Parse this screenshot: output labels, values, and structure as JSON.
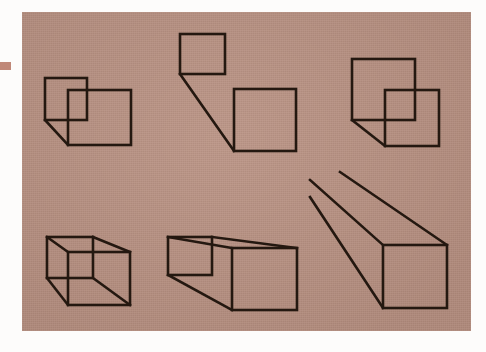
{
  "scene": {
    "title": "Line drawings of cubes and boxes in varying stages of construction",
    "background_color": "#ffffff",
    "panel_color": "#b89080",
    "line_color": "#241810",
    "edge_mark_color": "#c08878",
    "panel": {
      "x": 22,
      "y": 12,
      "width": 449,
      "height": 319
    },
    "edge_mark": {
      "x": 0,
      "y": 62,
      "width": 11,
      "height": 8
    }
  },
  "figures": [
    {
      "id": "figure-1",
      "name": "overlapping-squares-small-behind",
      "position": "top-left",
      "description": "A small square upper-left overlapping a larger square lower-right, joined by one diagonal line between their lower-left corners",
      "squares": [
        {
          "name": "back-square",
          "x": 45,
          "y": 78,
          "width": 42,
          "height": 42
        },
        {
          "name": "front-square",
          "x": 68,
          "y": 90,
          "width": 63,
          "height": 55
        }
      ],
      "connectors": [
        {
          "name": "lower-left-diagonal",
          "x1": 45,
          "y1": 120,
          "x2": 68,
          "y2": 145
        }
      ]
    },
    {
      "id": "figure-2",
      "name": "separated-squares-single-connector",
      "position": "top-center",
      "description": "Two detached squares — a small one upper-left, a larger one lower-right — joined by a single long diagonal",
      "squares": [
        {
          "name": "back-square",
          "x": 180,
          "y": 34,
          "width": 45,
          "height": 40
        },
        {
          "name": "front-square",
          "x": 234,
          "y": 89,
          "width": 62,
          "height": 62
        }
      ],
      "connectors": [
        {
          "name": "lower-left-diagonal",
          "x1": 180,
          "y1": 74,
          "x2": 234,
          "y2": 151
        }
      ]
    },
    {
      "id": "figure-3",
      "name": "overlapping-squares-large-behind",
      "position": "top-right",
      "description": "A large square upper-left overlapping a smaller square lower-right, joined by one diagonal between their lower-left corners",
      "squares": [
        {
          "name": "back-square",
          "x": 352,
          "y": 59,
          "width": 63,
          "height": 61
        },
        {
          "name": "front-square",
          "x": 385,
          "y": 90,
          "width": 54,
          "height": 56
        }
      ],
      "connectors": [
        {
          "name": "lower-left-diagonal",
          "x1": 352,
          "y1": 120,
          "x2": 385,
          "y2": 146
        }
      ]
    },
    {
      "id": "figure-4",
      "name": "wireframe-cube",
      "position": "bottom-left",
      "description": "A complete transparent wireframe cube: two overlapping squares joined at all four corners",
      "squares": [
        {
          "name": "back-square",
          "x": 47,
          "y": 237,
          "width": 46,
          "height": 41
        },
        {
          "name": "front-square",
          "x": 68,
          "y": 252,
          "width": 62,
          "height": 53
        }
      ],
      "connectors": [
        {
          "name": "top-left-edge",
          "x1": 47,
          "y1": 237,
          "x2": 68,
          "y2": 252
        },
        {
          "name": "top-right-edge",
          "x1": 93,
          "y1": 237,
          "x2": 130,
          "y2": 252
        },
        {
          "name": "bottom-left-edge",
          "x1": 47,
          "y1": 278,
          "x2": 68,
          "y2": 305
        },
        {
          "name": "bottom-right-edge",
          "x1": 93,
          "y1": 278,
          "x2": 130,
          "y2": 305
        }
      ]
    },
    {
      "id": "figure-5",
      "name": "elongated-box",
      "position": "bottom-center",
      "description": "An elongated open box: a small far square at the left joined by long edges to a larger near square at the right",
      "squares": [
        {
          "name": "back-square",
          "x": 168,
          "y": 237,
          "width": 44,
          "height": 38
        },
        {
          "name": "front-square",
          "x": 232,
          "y": 248,
          "width": 65,
          "height": 62
        }
      ],
      "connectors": [
        {
          "name": "top-left-edge",
          "x1": 168,
          "y1": 237,
          "x2": 232,
          "y2": 248
        },
        {
          "name": "top-right-edge",
          "x1": 212,
          "y1": 237,
          "x2": 297,
          "y2": 248
        },
        {
          "name": "bottom-left-edge",
          "x1": 168,
          "y1": 275,
          "x2": 232,
          "y2": 310
        }
      ]
    },
    {
      "id": "figure-6",
      "name": "long-receding-box",
      "position": "bottom-right",
      "description": "A very long box receding toward the upper left: three long parallel edges converging from off-figure to one near square at the lower right",
      "squares": [
        {
          "name": "front-square",
          "x": 383,
          "y": 245,
          "width": 64,
          "height": 63
        }
      ],
      "connectors": [
        {
          "name": "top-left-long-edge",
          "x1": 310,
          "y1": 180,
          "x2": 383,
          "y2": 245
        },
        {
          "name": "top-right-long-edge",
          "x1": 340,
          "y1": 172,
          "x2": 447,
          "y2": 245
        },
        {
          "name": "bottom-left-long-edge",
          "x1": 310,
          "y1": 197,
          "x2": 383,
          "y2": 308
        }
      ]
    }
  ]
}
